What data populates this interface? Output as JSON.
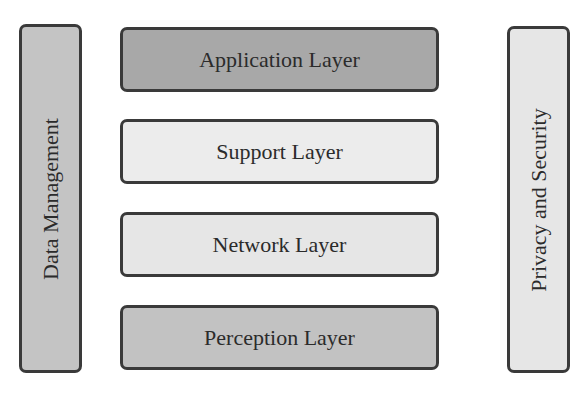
{
  "diagram": {
    "side_left": {
      "label": "Data Management",
      "fill": "#c4c4c4"
    },
    "side_right": {
      "label": "Privacy and Security",
      "fill": "#e6e6e6"
    },
    "layers": [
      {
        "label": "Application Layer",
        "fill": "#a8a8a8"
      },
      {
        "label": "Support Layer",
        "fill": "#ececec"
      },
      {
        "label": "Network Layer",
        "fill": "#e6e6e6"
      },
      {
        "label": "Perception Layer",
        "fill": "#c2c2c2"
      }
    ]
  }
}
